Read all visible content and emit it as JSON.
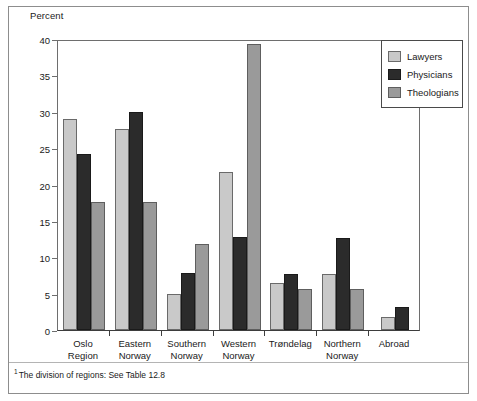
{
  "figure": {
    "y_axis_title": "Percent",
    "footnote_marker": "1",
    "footnote": "The division of regions: See Table 12.8"
  },
  "legend": {
    "items": [
      {
        "label": "Lawyers",
        "color": "#c9c9c9"
      },
      {
        "label": "Physicians",
        "color": "#2b2b2b"
      },
      {
        "label": "Theologians",
        "color": "#9a9a9a"
      }
    ]
  },
  "chart_data": {
    "type": "bar",
    "title": "",
    "subtitle": "",
    "xlabel": "",
    "ylabel": "Percent",
    "ylim": [
      0,
      40
    ],
    "yticks": [
      0,
      5,
      10,
      15,
      20,
      25,
      30,
      35,
      40
    ],
    "ytick_labels": [
      "0",
      "5",
      "10",
      "15",
      "20",
      "25",
      "30",
      "35",
      "40"
    ],
    "grid": false,
    "legend_position": "top-right",
    "categories": [
      "Oslo Region",
      "Eastern Norway",
      "Southern Norway",
      "Western Norway",
      "Trøndelag",
      "Northern Norway",
      "Abroad"
    ],
    "category_lines": [
      [
        "Oslo",
        "Region"
      ],
      [
        "Eastern",
        "Norway"
      ],
      [
        "Southern",
        "Norway"
      ],
      [
        "Western",
        "Norway"
      ],
      [
        "Trøndelag"
      ],
      [
        "Northern",
        "Norway"
      ],
      [
        "Abroad"
      ]
    ],
    "series": [
      {
        "name": "Lawyers",
        "color": "#c9c9c9",
        "values": [
          29.0,
          27.6,
          4.9,
          21.7,
          6.5,
          7.7,
          1.8
        ]
      },
      {
        "name": "Physicians",
        "color": "#2b2b2b",
        "values": [
          24.2,
          29.9,
          7.8,
          12.8,
          7.7,
          12.7,
          3.2
        ]
      },
      {
        "name": "Theologians",
        "color": "#9a9a9a",
        "values": [
          17.6,
          17.6,
          11.8,
          39.3,
          5.6,
          5.6,
          null
        ]
      }
    ],
    "annotations": []
  }
}
